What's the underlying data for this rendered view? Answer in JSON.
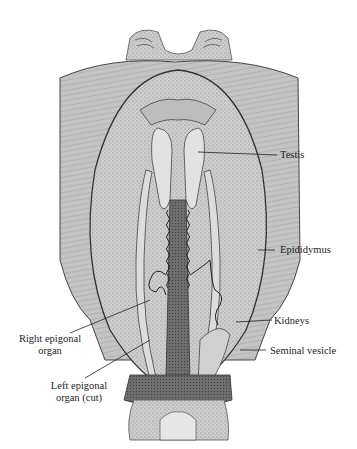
{
  "figure": {
    "colors": {
      "ink": "#2a2a2a",
      "stipple": "#8c8c8c",
      "tissue_light": "#d6d6d6",
      "tissue_mid": "#b4b4b4",
      "tissue_dark": "#5a5a5a",
      "background": "#ffffff"
    }
  },
  "labels": {
    "testis": "Testis",
    "epididymus": "Epididymus",
    "right_epigonal_line1": "Right epigonal",
    "right_epigonal_line2": "organ",
    "kidneys": "Kidneys",
    "seminal_vesicle": "Seminal vesicle",
    "left_epigonal_line1": "Left epigonal",
    "left_epigonal_line2": "organ (cut)"
  }
}
